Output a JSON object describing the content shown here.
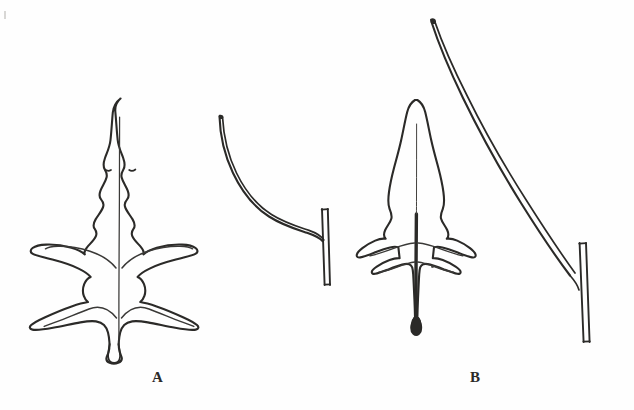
{
  "figure": {
    "kind": "botanical-line-drawing",
    "medium": "black ink outline on white paper",
    "width": 634,
    "height": 410,
    "background_color": "#fefefe",
    "ink_color": "#2b2a28",
    "caption_a": "A",
    "caption_b": "B",
    "specimen_count": 4,
    "group_count": 2
  },
  "specimens": [
    {
      "id": "leaf-a-basal",
      "group": "A",
      "name": "runcinate basal leaf",
      "description": "Deeply pinnatifid leaf with large triangular terminal lobe and several backward-pointing lateral lobes, tapering to a narrow winged petiole with a slightly swollen base.",
      "orientation": "upright",
      "lobe_pairs": 3,
      "has_midrib": true,
      "bbox": [
        78,
        96,
        205,
        365
      ]
    },
    {
      "id": "bract-a-curved",
      "group": "A",
      "name": "curved linear bract on stem",
      "description": "Slender arching linear leaf attached at a sharp angle to a short vertical stem segment drawn as two parallel lines.",
      "orientation": "arching left to right",
      "lobe_pairs": 0,
      "has_midrib": false,
      "bbox": [
        215,
        115,
        340,
        285
      ]
    },
    {
      "id": "leaf-b-basal",
      "group": "B",
      "name": "narrow hastate leaf",
      "description": "Long narrow lanceolate leaf with a pair of small spreading basal lobes and a second smaller pair below, on a thick dark midrib that widens at the base.",
      "orientation": "upright",
      "lobe_pairs": 2,
      "has_midrib": true,
      "bbox": [
        372,
        98,
        440,
        335
      ]
    },
    {
      "id": "leaf-b-cauline",
      "group": "B",
      "name": "long linear cauline leaf on stem",
      "description": "Very long, almost straight narrow linear leaf sloping from upper left to lower right, joining a vertical stem drawn as two parallel lines.",
      "orientation": "oblique, upper-left to lower-right",
      "lobe_pairs": 0,
      "has_midrib": false,
      "bbox": [
        430,
        18,
        605,
        345
      ]
    }
  ],
  "annotations": {
    "corner_speck": "printing speck",
    "stray_dot": "ink dot near leaf B base"
  }
}
